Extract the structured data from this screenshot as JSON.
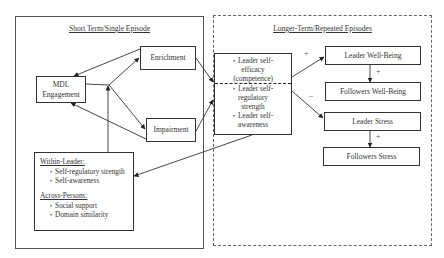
{
  "panels": {
    "left": {
      "title": "Short Term/Single Episode"
    },
    "right": {
      "title": "Longer-Term/Repeated Episodes"
    }
  },
  "nodes": {
    "mdl_engagement": "MDL Engagement",
    "mdl_line1": "MDL",
    "mdl_line2": "Engagement",
    "enrichment": "Enrichment",
    "impairment": "Impairment",
    "leader_well_being": "Leader Well-Being",
    "followers_well_being": "Followers Well-Being",
    "leader_stress": "Leader Stress",
    "followers_stress": "Followers Stress"
  },
  "central_box": {
    "items": [
      {
        "lines": [
          "Leader self-",
          "efficacy",
          "(competence)"
        ]
      },
      {
        "lines": [
          "Leader self-",
          "regulatory",
          "strength"
        ]
      },
      {
        "lines": [
          "Leader self-",
          "awareness"
        ]
      }
    ]
  },
  "moderators": {
    "within_leader": {
      "header": "Within-Leader:",
      "items": [
        "Self-regulatory strength",
        "Self-awareness"
      ]
    },
    "across_persons": {
      "header": "Across-Persons:",
      "items": [
        "Social support",
        "Domain similarity"
      ]
    }
  },
  "signs": {
    "to_leader_well_being": "+",
    "to_leader_stress": "–",
    "leader_to_followers_well_being": "+",
    "leader_to_followers_stress": "+"
  },
  "edges": [
    {
      "from": "mdl_engagement",
      "to": "enrichment"
    },
    {
      "from": "mdl_engagement",
      "to": "impairment"
    },
    {
      "from": "enrichment",
      "to": "mdl_engagement"
    },
    {
      "from": "impairment",
      "to": "mdl_engagement"
    },
    {
      "from": "moderators",
      "to": "mdl_engagement-enrichment/impairment link"
    },
    {
      "from": "enrichment",
      "to": "central_box"
    },
    {
      "from": "impairment",
      "to": "central_box"
    },
    {
      "from": "central_box",
      "to": "moderators"
    },
    {
      "from": "central_box",
      "to": "leader_well_being",
      "sign": "+"
    },
    {
      "from": "central_box",
      "to": "leader_stress",
      "sign": "–"
    },
    {
      "from": "leader_well_being",
      "to": "followers_well_being",
      "sign": "+"
    },
    {
      "from": "leader_stress",
      "to": "followers_stress",
      "sign": "+"
    }
  ]
}
